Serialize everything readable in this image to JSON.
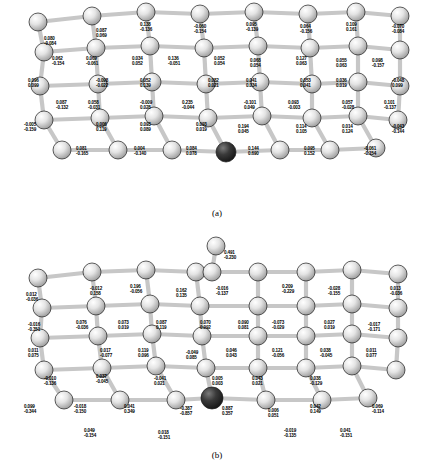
{
  "figure": {
    "caption_a": "(a)",
    "caption_b": "(b)"
  },
  "panel_a": {
    "labels": [
      {
        "x": 44,
        "y": 36,
        "v1": "0.080",
        "v2": "-0.084"
      },
      {
        "x": 96,
        "y": 28,
        "v1": "0.087",
        "v2": "0.069"
      },
      {
        "x": 140,
        "y": 22,
        "v1": "0.138",
        "v2": "-0.136"
      },
      {
        "x": 194,
        "y": 24,
        "v1": "-0.060",
        "v2": "-0.154"
      },
      {
        "x": 246,
        "y": 22,
        "v1": "0.095",
        "v2": "-0.139"
      },
      {
        "x": 300,
        "y": 24,
        "v1": "0.064",
        "v2": "-0.156"
      },
      {
        "x": 346,
        "y": 22,
        "v1": "0.109",
        "v2": "0.161"
      },
      {
        "x": 392,
        "y": 24,
        "v1": "-0.070",
        "v2": "-0.084"
      },
      {
        "x": 52,
        "y": 56,
        "v1": "0.062",
        "v2": "-0.154"
      },
      {
        "x": 86,
        "y": 56,
        "v1": "0.069",
        "v2": "-0.061"
      },
      {
        "x": 132,
        "y": 56,
        "v1": "0.034",
        "v2": "0.052"
      },
      {
        "x": 168,
        "y": 56,
        "v1": "0.136",
        "v2": "-0.051"
      },
      {
        "x": 214,
        "y": 56,
        "v1": "0.052",
        "v2": "0.054"
      },
      {
        "x": 250,
        "y": 58,
        "v1": "0.068",
        "v2": "0.054"
      },
      {
        "x": 296,
        "y": 56,
        "v1": "0.127",
        "v2": "0.063"
      },
      {
        "x": 336,
        "y": 58,
        "v1": "0.055",
        "v2": "0.063"
      },
      {
        "x": 372,
        "y": 58,
        "v1": "0.098",
        "v2": "-0.157"
      },
      {
        "x": 28,
        "y": 78,
        "v1": "0.096",
        "v2": "0.099"
      },
      {
        "x": 96,
        "y": 78,
        "v1": "-0.098",
        "v2": "-0.022"
      },
      {
        "x": 140,
        "y": 78,
        "v1": "0.052",
        "v2": "0.139"
      },
      {
        "x": 208,
        "y": 78,
        "v1": "0.082",
        "v2": "0.021"
      },
      {
        "x": 246,
        "y": 78,
        "v1": "0.041",
        "v2": "0.034"
      },
      {
        "x": 300,
        "y": 78,
        "v1": "0.053",
        "v2": "0.041"
      },
      {
        "x": 336,
        "y": 78,
        "v1": "0.036",
        "v2": "0.019"
      },
      {
        "x": 392,
        "y": 78,
        "v1": "-0.048",
        "v2": "0.099"
      },
      {
        "x": 56,
        "y": 100,
        "v1": "0.087",
        "v2": "-0.132"
      },
      {
        "x": 88,
        "y": 100,
        "v1": "0.058",
        "v2": "-0.031"
      },
      {
        "x": 140,
        "y": 100,
        "v1": "-0.009",
        "v2": "0.028"
      },
      {
        "x": 182,
        "y": 100,
        "v1": "0.235",
        "v2": "-0.044"
      },
      {
        "x": 244,
        "y": 100,
        "v1": "-0.101",
        "v2": "0.049"
      },
      {
        "x": 288,
        "y": 100,
        "v1": "0.093",
        "v2": "-0.003"
      },
      {
        "x": 342,
        "y": 100,
        "v1": "0.057",
        "v2": "-0.028"
      },
      {
        "x": 384,
        "y": 100,
        "v1": "0.101",
        "v2": "-0.137"
      },
      {
        "x": 24,
        "y": 122,
        "v1": "-0.005",
        "v2": "-0.159"
      },
      {
        "x": 96,
        "y": 122,
        "v1": "0.006",
        "v2": "0.119"
      },
      {
        "x": 140,
        "y": 122,
        "v1": "0.093",
        "v2": "0.089"
      },
      {
        "x": 196,
        "y": 122,
        "v1": "0.093",
        "v2": "0.019"
      },
      {
        "x": 238,
        "y": 124,
        "v1": "0.194",
        "v2": "0.045"
      },
      {
        "x": 296,
        "y": 124,
        "v1": "0.114",
        "v2": "0.105"
      },
      {
        "x": 342,
        "y": 124,
        "v1": "0.014",
        "v2": "0.124"
      },
      {
        "x": 392,
        "y": 124,
        "v1": "-0.043",
        "v2": "-0.144"
      },
      {
        "x": 76,
        "y": 146,
        "v1": "0.081",
        "v2": "-0.165"
      },
      {
        "x": 134,
        "y": 146,
        "v1": "0.004",
        "v2": "-0.140"
      },
      {
        "x": 186,
        "y": 146,
        "v1": "0.084",
        "v2": "0.078"
      },
      {
        "x": 248,
        "y": 146,
        "v1": "0.144",
        "v2": "0.690"
      },
      {
        "x": 304,
        "y": 146,
        "v1": "0.095",
        "v2": "0.152"
      },
      {
        "x": 364,
        "y": 146,
        "v1": "-0.061",
        "v2": "-0.154"
      }
    ]
  },
  "panel_b": {
    "labels": [
      {
        "x": 224,
        "y": 22,
        "v1": "0.491",
        "v2": "-0.230"
      },
      {
        "x": 26,
        "y": 64,
        "v1": "0.012",
        "v2": "-0.036"
      },
      {
        "x": 90,
        "y": 58,
        "v1": "-0.012",
        "v2": "0.158"
      },
      {
        "x": 130,
        "y": 56,
        "v1": "0.196",
        "v2": "-0.056"
      },
      {
        "x": 176,
        "y": 60,
        "v1": "0.162",
        "v2": "0.135"
      },
      {
        "x": 216,
        "y": 58,
        "v1": "-0.016",
        "v2": "-0.137"
      },
      {
        "x": 282,
        "y": 56,
        "v1": "0.209",
        "v2": "-0.229"
      },
      {
        "x": 328,
        "y": 58,
        "v1": "-0.028",
        "v2": "-0.155"
      },
      {
        "x": 390,
        "y": 58,
        "v1": "0.013",
        "v2": "-0.036"
      },
      {
        "x": 28,
        "y": 94,
        "v1": "-0.016",
        "v2": "-0.351"
      },
      {
        "x": 76,
        "y": 92,
        "v1": "0.076",
        "v2": "-0.036"
      },
      {
        "x": 118,
        "y": 92,
        "v1": "0.073",
        "v2": "0.019"
      },
      {
        "x": 156,
        "y": 92,
        "v1": "0.087",
        "v2": "0.119"
      },
      {
        "x": 200,
        "y": 92,
        "v1": "0.070",
        "v2": "0.092"
      },
      {
        "x": 238,
        "y": 92,
        "v1": "0.090",
        "v2": "0.081"
      },
      {
        "x": 272,
        "y": 92,
        "v1": "-0.073",
        "v2": "-0.029"
      },
      {
        "x": 324,
        "y": 92,
        "v1": "0.027",
        "v2": "0.019"
      },
      {
        "x": 368,
        "y": 94,
        "v1": "-0.017",
        "v2": "-0.171"
      },
      {
        "x": 28,
        "y": 120,
        "v1": "0.011",
        "v2": "0.075"
      },
      {
        "x": 100,
        "y": 120,
        "v1": "0.017",
        "v2": "-0.077"
      },
      {
        "x": 138,
        "y": 120,
        "v1": "0.119",
        "v2": "0.096"
      },
      {
        "x": 186,
        "y": 122,
        "v1": "-0.049",
        "v2": "0.085"
      },
      {
        "x": 226,
        "y": 120,
        "v1": "0.046",
        "v2": "0.043"
      },
      {
        "x": 272,
        "y": 120,
        "v1": "0.121",
        "v2": "-0.056"
      },
      {
        "x": 320,
        "y": 120,
        "v1": "0.038",
        "v2": "-0.045"
      },
      {
        "x": 366,
        "y": 120,
        "v1": "0.011",
        "v2": "0.077"
      },
      {
        "x": 44,
        "y": 148,
        "v1": "-0.010",
        "v2": "-0.136"
      },
      {
        "x": 96,
        "y": 146,
        "v1": "0.037",
        "v2": "-0.045"
      },
      {
        "x": 154,
        "y": 148,
        "v1": "-0.041",
        "v2": "0.021"
      },
      {
        "x": 212,
        "y": 148,
        "v1": "0.005",
        "v2": "0.003"
      },
      {
        "x": 252,
        "y": 148,
        "v1": "0.043",
        "v2": "0.021"
      },
      {
        "x": 310,
        "y": 148,
        "v1": "0.038",
        "v2": "-0.129"
      },
      {
        "x": 24,
        "y": 176,
        "v1": "0.099",
        "v2": "-0.344"
      },
      {
        "x": 74,
        "y": 176,
        "v1": "-0.018",
        "v2": "-0.150"
      },
      {
        "x": 124,
        "y": 176,
        "v1": "0.041",
        "v2": "0.349"
      },
      {
        "x": 180,
        "y": 178,
        "v1": "-0.387",
        "v2": "-0.857"
      },
      {
        "x": 222,
        "y": 178,
        "v1": "0.887",
        "v2": "0.357"
      },
      {
        "x": 268,
        "y": 180,
        "v1": "0.006",
        "v2": "0.051"
      },
      {
        "x": 310,
        "y": 176,
        "v1": "0.042",
        "v2": "0.149"
      },
      {
        "x": 372,
        "y": 176,
        "v1": "0.069",
        "v2": "-0.114"
      },
      {
        "x": 84,
        "y": 200,
        "v1": "0.049",
        "v2": "-0.154"
      },
      {
        "x": 158,
        "y": 202,
        "v1": "0.018",
        "v2": "-0.151"
      },
      {
        "x": 284,
        "y": 200,
        "v1": "-0.019",
        "v2": "-0.135"
      },
      {
        "x": 340,
        "y": 200,
        "v1": "0.041",
        "v2": "-0.151"
      }
    ]
  },
  "colors": {
    "atom_light": "#d9d9d9",
    "atom_dark": "#2b2b2b",
    "bond": "#bdbdbd",
    "outline": "#111111",
    "background": "#ffffff"
  }
}
